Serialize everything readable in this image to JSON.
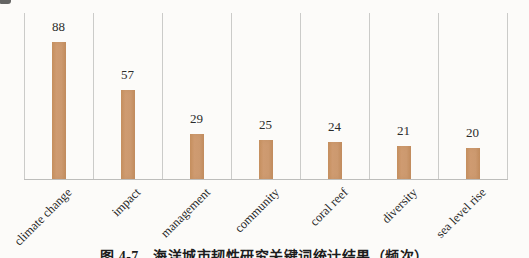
{
  "chart_data": {
    "type": "bar",
    "categories": [
      "climate change",
      "impact",
      "management",
      "community",
      "coral reef",
      "diversity",
      "sea level rise"
    ],
    "values": [
      88,
      57,
      29,
      25,
      24,
      21,
      20
    ],
    "value_labels": [
      "88",
      "57",
      "29",
      "25",
      "24",
      "21",
      "20"
    ],
    "title": "",
    "xlabel": "",
    "ylabel": "",
    "ylim": [
      0,
      95
    ],
    "grid": "vertical-category-separators",
    "legend": "none",
    "bar_color": "#cd9a70",
    "gridline_color": "#cbcbc9",
    "label_color": "#2b2b2b"
  },
  "caption": {
    "text": "图 4-7　海洋城市韧性研究关键词统计结果（频次）"
  }
}
